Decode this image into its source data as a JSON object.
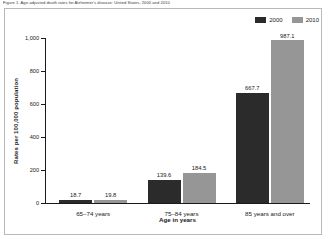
{
  "figure": {
    "title": "Figure 1. Age-adjusted death rates for Alzheimer's disease: United States, 2000 and 2010"
  },
  "legend": {
    "position": "top-right",
    "entries": [
      {
        "label": "2000",
        "color": "#2b2b2b",
        "swatch_name": "legend-swatch-2000"
      },
      {
        "label": "2010",
        "color": "#969696",
        "swatch_name": "legend-swatch-2010"
      }
    ]
  },
  "axes": {
    "ylabel": "Rates per 100,000 population",
    "xlabel": "Age in years",
    "yticks": [
      "0",
      "200",
      "400",
      "600",
      "800",
      "1,000"
    ],
    "ytick_values": [
      0,
      200,
      400,
      600,
      800,
      1000
    ]
  },
  "chart_data": {
    "type": "bar",
    "title": "Figure 1. Age-adjusted death rates for Alzheimer's disease: United States, 2000 and 2010",
    "xlabel": "Age in years",
    "ylabel": "Rates per 100,000 population",
    "ylim": [
      0,
      1000
    ],
    "yticks": [
      0,
      200,
      400,
      600,
      800,
      1000
    ],
    "grid": false,
    "legend_position": "top-right",
    "categories": [
      "65–74 years",
      "75–84 years",
      "85 years and over"
    ],
    "series": [
      {
        "name": "2000",
        "color": "#2b2b2b",
        "values": [
          18.7,
          139.6,
          667.7
        ],
        "labels": [
          "18.7",
          "139.6",
          "667.7"
        ]
      },
      {
        "name": "2010",
        "color": "#969696",
        "values": [
          19.8,
          184.5,
          987.1
        ],
        "labels": [
          "19.8",
          "184.5",
          "987.1"
        ]
      }
    ]
  }
}
